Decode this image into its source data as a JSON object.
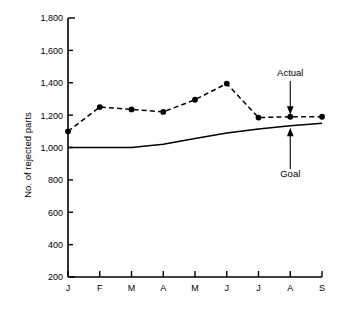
{
  "chart_data": {
    "type": "line",
    "title": "",
    "xlabel": "",
    "ylabel": "No. of rejected parts",
    "categories": [
      "J",
      "F",
      "M",
      "A",
      "M",
      "J",
      "J",
      "A",
      "S"
    ],
    "ylim": [
      200,
      1800
    ],
    "ytick_labels": [
      "1,800",
      "1,600",
      "1,400",
      "1,200",
      "1,000",
      "800",
      "600",
      "400",
      "200"
    ],
    "ytick_values": [
      1800,
      1600,
      1400,
      1200,
      1000,
      800,
      600,
      400,
      200
    ],
    "grid": false,
    "legend": "annotations",
    "series": [
      {
        "name": "Actual",
        "style": "dashed",
        "marker": "filled-circle",
        "values": [
          1100,
          1250,
          1235,
          1220,
          1295,
          1395,
          1185,
          1190,
          1190
        ]
      },
      {
        "name": "Goal",
        "style": "solid",
        "marker": "none",
        "values": [
          1000,
          1000,
          1000,
          1020,
          1055,
          1090,
          1115,
          1135,
          1150
        ]
      }
    ],
    "annotations": [
      {
        "label": "Actual",
        "target_series": "Actual",
        "target_category": "A",
        "direction": "down"
      },
      {
        "label": "Goal",
        "target_series": "Goal",
        "target_category": "A",
        "direction": "up"
      }
    ]
  },
  "colors": {
    "axis": "#000000",
    "actual": "#000000",
    "goal": "#000000",
    "background": "#ffffff"
  }
}
